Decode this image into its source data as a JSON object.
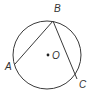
{
  "diagram": {
    "type": "circle-inscribed-angle",
    "circle": {
      "cx": 47,
      "cy": 55,
      "r": 34,
      "stroke": "#3a3a3a"
    },
    "center": {
      "label": "O",
      "x": 48,
      "y": 55,
      "label_x": 52,
      "label_y": 59
    },
    "points": [
      {
        "label": "A",
        "x": 15,
        "y": 64,
        "label_x": 5,
        "label_y": 70
      },
      {
        "label": "B",
        "x": 53,
        "y": 21,
        "label_x": 54,
        "label_y": 12
      },
      {
        "label": "C",
        "x": 77,
        "y": 79,
        "label_x": 79,
        "label_y": 88
      }
    ],
    "chords": [
      {
        "from": "A",
        "to": "B"
      },
      {
        "from": "B",
        "to": "C"
      }
    ],
    "colors": {
      "line": "#3a3a3a",
      "label": "#333333",
      "background": "#ffffff"
    }
  }
}
